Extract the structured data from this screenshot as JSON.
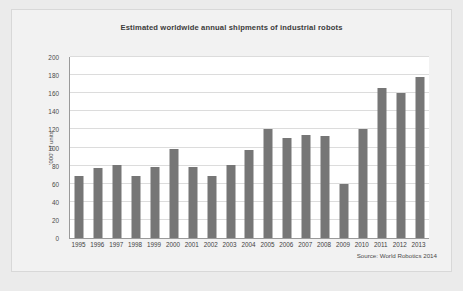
{
  "chart_data": {
    "type": "bar",
    "title": "Estimated worldwide annual shipments of industrial robots",
    "xlabel": "",
    "ylabel": "'000' of units",
    "ylim": [
      0,
      200
    ],
    "yticks": [
      0,
      20,
      40,
      60,
      80,
      100,
      120,
      140,
      160,
      180,
      200
    ],
    "grid": true,
    "legend": null,
    "bar_color": "#767676",
    "plot_background": "#ffffff",
    "categories": [
      "1995",
      "1996",
      "1997",
      "1998",
      "1999",
      "2000",
      "2001",
      "2002",
      "2003",
      "2004",
      "2005",
      "2006",
      "2007",
      "2008",
      "2009",
      "2010",
      "2011",
      "2012",
      "2013"
    ],
    "values": [
      69,
      77,
      81,
      69,
      79,
      98,
      78,
      68,
      81,
      97,
      120,
      111,
      114,
      113,
      60,
      121,
      166,
      160,
      178
    ],
    "annotations": [
      "Source: World Robotics 2014"
    ]
  },
  "figure": {
    "source_note": "Source: World Robotics 2014"
  }
}
